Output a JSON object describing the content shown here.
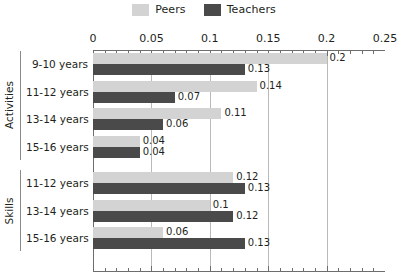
{
  "legend": {
    "entries": [
      {
        "label": "Peers",
        "color": "#d3d3d3",
        "icon": "legend-swatch-icon"
      },
      {
        "label": "Teachers",
        "color": "#4a4a4a",
        "icon": "legend-swatch-icon"
      }
    ]
  },
  "axis": {
    "ticks": [
      "0",
      "0.05",
      "0.1",
      "0.15",
      "0.2",
      "0.25"
    ]
  },
  "groups": [
    {
      "label": "Activities"
    },
    {
      "label": "Skills"
    }
  ],
  "rows": [
    {
      "group": "Activities",
      "category": "9-10 years",
      "peers": "0.2",
      "teachers": "0.13"
    },
    {
      "group": "Activities",
      "category": "11-12 years",
      "peers": "0.14",
      "teachers": "0.07"
    },
    {
      "group": "Activities",
      "category": "13-14 years",
      "peers": "0.11",
      "teachers": "0.06"
    },
    {
      "group": "Activities",
      "category": "15-16 years",
      "peers": "0.04",
      "teachers": "0.04"
    },
    {
      "group": "Skills",
      "category": "11-12 years",
      "peers": "0.12",
      "teachers": "0.13"
    },
    {
      "group": "Skills",
      "category": "13-14 years",
      "peers": "0.1",
      "teachers": "0.12"
    },
    {
      "group": "Skills",
      "category": "15-16 years",
      "peers": "0.06",
      "teachers": "0.13"
    }
  ],
  "chart_data": {
    "type": "bar",
    "orientation": "horizontal",
    "title": "",
    "xlabel": "",
    "ylabel": "",
    "xlim": [
      0,
      0.25
    ],
    "xticks": [
      0,
      0.05,
      0.1,
      0.15,
      0.2,
      0.25
    ],
    "minor_tick_step": 0.01,
    "grid": "vertical-major",
    "legend_position": "top-center",
    "group_axis": [
      "Activities",
      "Skills"
    ],
    "categories": [
      "Activities: 9-10 years",
      "Activities: 11-12 years",
      "Activities: 13-14 years",
      "Activities: 15-16 years",
      "Skills: 11-12 years",
      "Skills: 13-14 years",
      "Skills: 15-16 years"
    ],
    "series": [
      {
        "name": "Peers",
        "color": "#d3d3d3",
        "values": [
          0.2,
          0.14,
          0.11,
          0.04,
          0.12,
          0.1,
          0.06
        ]
      },
      {
        "name": "Teachers",
        "color": "#4a4a4a",
        "values": [
          0.13,
          0.07,
          0.06,
          0.04,
          0.13,
          0.12,
          0.13
        ]
      }
    ],
    "data_labels": [
      {
        "category": "Activities: 9-10 years",
        "Peers": "0.2",
        "Teachers": "0.13"
      },
      {
        "category": "Activities: 11-12 years",
        "Peers": "0.14",
        "Teachers": "0.07"
      },
      {
        "category": "Activities: 13-14 years",
        "Peers": "0.11",
        "Teachers": "0.06"
      },
      {
        "category": "Activities: 15-16 years",
        "Peers": "0.04",
        "Teachers": "0.04"
      },
      {
        "category": "Skills: 11-12 years",
        "Peers": "0.12",
        "Teachers": "0.13"
      },
      {
        "category": "Skills: 13-14 years",
        "Peers": "0.1",
        "Teachers": "0.12"
      },
      {
        "category": "Skills: 15-16 years",
        "Peers": "0.06",
        "Teachers": "0.13"
      }
    ]
  }
}
